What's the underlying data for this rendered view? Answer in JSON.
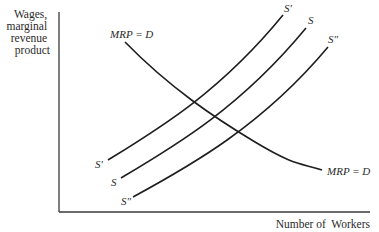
{
  "diagram": {
    "y_axis_label": [
      "Wages,",
      "marginal",
      "revenue",
      "product"
    ],
    "x_axis_label": "Number of  Workers",
    "demand_curve": {
      "label_top": "MRP = D",
      "label_bottom": "MRP = D"
    },
    "supply_curves": [
      {
        "name": "S'",
        "label_top": "S′",
        "label_bottom": "S′"
      },
      {
        "name": "S",
        "label_top": "S",
        "label_bottom": "S"
      },
      {
        "name": "S''",
        "label_top": "S″",
        "label_bottom": "S″"
      }
    ],
    "colors": {
      "line": "#1e1e1e",
      "text": "#2a2a2a",
      "background": "#ffffff"
    }
  }
}
